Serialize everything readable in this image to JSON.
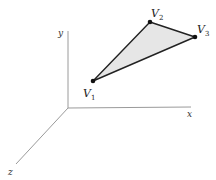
{
  "diagram": {
    "type": "3d-triangle-in-coordinate-axes",
    "axes": {
      "x": {
        "label": "x"
      },
      "y": {
        "label": "y"
      },
      "z": {
        "label": "z"
      }
    },
    "vertices": [
      {
        "name": "V",
        "sub": "1"
      },
      {
        "name": "V",
        "sub": "2"
      },
      {
        "name": "V",
        "sub": "3"
      }
    ],
    "colors": {
      "axis": "#9a9a9a",
      "edge": "#222222",
      "fill": "#e6e6e6",
      "vertex": "#111111"
    }
  }
}
